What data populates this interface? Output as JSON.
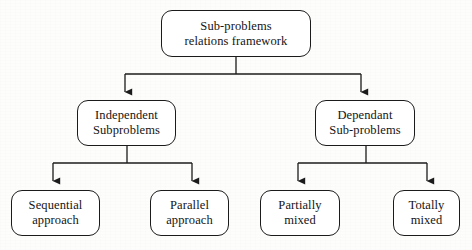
{
  "diagram": {
    "type": "tree-flowchart",
    "orientation": "top-down",
    "colors": {
      "background": "#fdfdfc",
      "node_fill": "#ffffff",
      "stroke": "#1b1b1b",
      "text": "#141414"
    },
    "nodes": {
      "root": {
        "id": "root",
        "line1": "Sub-problems",
        "line2": "relations framework"
      },
      "independent": {
        "id": "independent",
        "line1": "Independent",
        "line2": "Subproblems"
      },
      "dependant": {
        "id": "dependant",
        "line1": "Dependant",
        "line2": "Sub-problems"
      },
      "sequential": {
        "id": "sequential",
        "line1": "Sequential",
        "line2": "approach"
      },
      "parallel": {
        "id": "parallel",
        "line1": "Parallel",
        "line2": "approach"
      },
      "partially": {
        "id": "partially",
        "line1": "Partially",
        "line2": "mixed"
      },
      "totally": {
        "id": "totally",
        "line1": "Totally",
        "line2": "mixed"
      }
    },
    "edges": [
      {
        "from": "root",
        "to": "independent",
        "style": "elbow-arrow"
      },
      {
        "from": "root",
        "to": "dependant",
        "style": "elbow-arrow"
      },
      {
        "from": "independent",
        "to": "sequential",
        "style": "elbow-arrow"
      },
      {
        "from": "independent",
        "to": "parallel",
        "style": "elbow-arrow"
      },
      {
        "from": "dependant",
        "to": "partially",
        "style": "elbow-arrow"
      },
      {
        "from": "dependant",
        "to": "totally",
        "style": "elbow-arrow"
      }
    ]
  }
}
